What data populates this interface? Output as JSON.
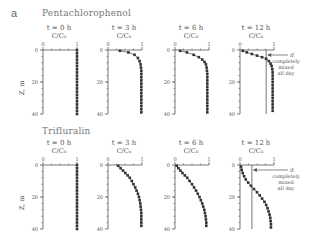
{
  "panel_label": "a",
  "chart_data": [
    {
      "type": "line",
      "compound": "Pentachlorophenol",
      "xlabel": "C/C0",
      "ylabel": "Z, m",
      "xlim": [
        0,
        1
      ],
      "ylim": [
        0,
        40
      ],
      "y_ticks": [
        0,
        20,
        40
      ],
      "x_ticks": [
        "0",
        "1"
      ],
      "panels": [
        {
          "title": "t = 0 h",
          "points": [
            [
              1,
              0
            ],
            [
              1,
              2
            ],
            [
              1,
              4
            ],
            [
              1,
              6
            ],
            [
              1,
              8
            ],
            [
              1,
              10
            ],
            [
              1,
              12
            ],
            [
              1,
              14
            ],
            [
              1,
              16
            ],
            [
              1,
              18
            ],
            [
              1,
              20
            ],
            [
              1,
              22
            ],
            [
              1,
              24
            ],
            [
              1,
              26
            ],
            [
              1,
              28
            ],
            [
              1,
              30
            ],
            [
              1,
              32
            ],
            [
              1,
              34
            ],
            [
              1,
              36
            ],
            [
              1,
              38
            ],
            [
              1,
              40
            ]
          ]
        },
        {
          "title": "t = 3 h",
          "points": [
            [
              0.35,
              0.5
            ],
            [
              0.6,
              1.5
            ],
            [
              0.78,
              3
            ],
            [
              0.88,
              5
            ],
            [
              0.93,
              7
            ],
            [
              0.96,
              9
            ],
            [
              0.97,
              11
            ],
            [
              0.98,
              13
            ],
            [
              0.98,
              15
            ],
            [
              0.98,
              17
            ],
            [
              0.98,
              19
            ],
            [
              0.98,
              21
            ],
            [
              0.98,
              23
            ],
            [
              0.98,
              25
            ],
            [
              0.98,
              27
            ],
            [
              0.98,
              29
            ],
            [
              0.98,
              31
            ],
            [
              0.98,
              33
            ],
            [
              0.98,
              35
            ],
            [
              0.98,
              37
            ],
            [
              0.98,
              39
            ]
          ]
        },
        {
          "title": "t = 6 h",
          "points": [
            [
              0.15,
              0.5
            ],
            [
              0.35,
              1.5
            ],
            [
              0.55,
              3
            ],
            [
              0.7,
              4.5
            ],
            [
              0.8,
              6
            ],
            [
              0.87,
              7.5
            ],
            [
              0.91,
              9
            ],
            [
              0.93,
              11
            ],
            [
              0.94,
              13
            ],
            [
              0.95,
              15
            ],
            [
              0.95,
              17
            ],
            [
              0.95,
              19
            ],
            [
              0.95,
              21
            ],
            [
              0.95,
              23
            ],
            [
              0.95,
              25
            ],
            [
              0.95,
              27
            ],
            [
              0.95,
              29
            ],
            [
              0.95,
              31
            ],
            [
              0.95,
              33
            ],
            [
              0.95,
              35
            ],
            [
              0.95,
              37
            ],
            [
              0.95,
              39
            ]
          ]
        },
        {
          "title": "t = 12 h",
          "points": [
            [
              0.08,
              0.5
            ],
            [
              0.2,
              1.5
            ],
            [
              0.35,
              2.5
            ],
            [
              0.5,
              3.5
            ],
            [
              0.65,
              4.5
            ],
            [
              0.77,
              5.5
            ],
            [
              0.85,
              7
            ],
            [
              0.9,
              8.5
            ],
            [
              0.93,
              10
            ],
            [
              0.95,
              12
            ],
            [
              0.96,
              14
            ],
            [
              0.96,
              16
            ],
            [
              0.96,
              18
            ],
            [
              0.96,
              20
            ],
            [
              0.96,
              22
            ],
            [
              0.96,
              24
            ],
            [
              0.96,
              26
            ],
            [
              0.96,
              28
            ],
            [
              0.96,
              30
            ],
            [
              0.96,
              32
            ],
            [
              0.96,
              34
            ],
            [
              0.96,
              36
            ],
            [
              0.96,
              38
            ]
          ],
          "mixed_line_x": 0.77,
          "annotation": "if completely mixed all day"
        }
      ]
    },
    {
      "type": "line",
      "compound": "Trifluralin",
      "xlabel": "C/C0",
      "ylabel": "Z, m",
      "xlim": [
        0,
        1
      ],
      "ylim": [
        0,
        40
      ],
      "y_ticks": [
        0,
        20,
        40
      ],
      "x_ticks": [
        "0",
        "1"
      ],
      "panels": [
        {
          "title": "t = 0 h",
          "points": [
            [
              1,
              0
            ],
            [
              1,
              2
            ],
            [
              1,
              4
            ],
            [
              1,
              6
            ],
            [
              1,
              8
            ],
            [
              1,
              10
            ],
            [
              1,
              12
            ],
            [
              1,
              14
            ],
            [
              1,
              16
            ],
            [
              1,
              18
            ],
            [
              1,
              20
            ],
            [
              1,
              22
            ],
            [
              1,
              24
            ],
            [
              1,
              26
            ],
            [
              1,
              28
            ],
            [
              1,
              30
            ],
            [
              1,
              32
            ],
            [
              1,
              34
            ],
            [
              1,
              36
            ],
            [
              1,
              38
            ],
            [
              1,
              40
            ]
          ]
        },
        {
          "title": "t = 3 h",
          "points": [
            [
              0.3,
              0.5
            ],
            [
              0.37,
              2
            ],
            [
              0.44,
              3.5
            ],
            [
              0.51,
              5
            ],
            [
              0.58,
              6.5
            ],
            [
              0.64,
              8
            ],
            [
              0.7,
              10
            ],
            [
              0.75,
              12
            ],
            [
              0.8,
              14
            ],
            [
              0.84,
              16
            ],
            [
              0.88,
              18
            ],
            [
              0.91,
              20
            ],
            [
              0.93,
              22
            ],
            [
              0.95,
              24
            ],
            [
              0.96,
              26
            ],
            [
              0.97,
              28
            ],
            [
              0.98,
              30
            ],
            [
              0.98,
              32
            ],
            [
              0.98,
              34
            ],
            [
              0.98,
              36
            ],
            [
              0.98,
              38
            ]
          ]
        },
        {
          "title": "t = 6 h",
          "points": [
            [
              0.05,
              0.5
            ],
            [
              0.1,
              2
            ],
            [
              0.16,
              3.5
            ],
            [
              0.22,
              5
            ],
            [
              0.29,
              6.5
            ],
            [
              0.36,
              8
            ],
            [
              0.43,
              10
            ],
            [
              0.5,
              12
            ],
            [
              0.56,
              14
            ],
            [
              0.62,
              16
            ],
            [
              0.67,
              18
            ],
            [
              0.72,
              20
            ],
            [
              0.76,
              22
            ],
            [
              0.8,
              24
            ],
            [
              0.83,
              26
            ],
            [
              0.86,
              28
            ],
            [
              0.88,
              30
            ],
            [
              0.9,
              32
            ],
            [
              0.91,
              34
            ],
            [
              0.92,
              36
            ],
            [
              0.92,
              38
            ]
          ]
        },
        {
          "title": "t = 12 h",
          "points": [
            [
              0.03,
              1
            ],
            [
              0.05,
              3
            ],
            [
              0.08,
              5
            ],
            [
              0.12,
              7
            ],
            [
              0.17,
              9
            ],
            [
              0.24,
              11
            ],
            [
              0.32,
              13
            ],
            [
              0.41,
              15
            ],
            [
              0.5,
              17
            ],
            [
              0.58,
              19
            ],
            [
              0.65,
              21
            ],
            [
              0.72,
              23
            ],
            [
              0.77,
              25
            ],
            [
              0.81,
              27
            ],
            [
              0.84,
              29
            ],
            [
              0.87,
              31
            ],
            [
              0.89,
              33
            ],
            [
              0.9,
              35
            ],
            [
              0.91,
              37
            ],
            [
              0.91,
              39
            ]
          ],
          "mixed_line_x": 0.35,
          "annotation": "if completely mixed all day"
        }
      ]
    }
  ]
}
